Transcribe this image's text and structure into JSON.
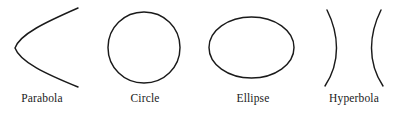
{
  "figure": {
    "background_color": "#ffffff",
    "stroke_color": "#1a1a1a",
    "width": 400,
    "height": 115,
    "items": [
      {
        "name": "parabola",
        "label": "Parabola",
        "label_x": 42,
        "label_y": 92,
        "path": "M 78 8 C 46 22 20 34 15 48 C 20 62 46 74 78 87"
      },
      {
        "name": "circle",
        "label": "Circle",
        "label_x": 145,
        "label_y": 92,
        "path": "M 108 47.5 C 108 27.5 124 12 144 12 C 164 12 180 27.5 180 47.5 C 180 67.5 164 83 144 83 C 124 83 108 67.5 108 47.5 Z"
      },
      {
        "name": "ellipse",
        "label": "Ellipse",
        "label_x": 253,
        "label_y": 92,
        "path": "M 209 47.5 C 209 30.5 228 17 251.5 17 C 275 17 294 30.5 294 47.5 C 294 64.5 275 78 251.5 78 C 228 78 209 64.5 209 47.5 Z"
      },
      {
        "name": "hyperbola",
        "label": "Hyperbola",
        "label_x": 354,
        "label_y": 92,
        "path_left": "M 327 10 C 334 24 336.5 36 336.5 48 C 336.5 61 333 74 325 86",
        "path_right": "M 381 10 C 374 24 371.5 36 371.5 48 C 371.5 61 375 74 383 86"
      }
    ]
  }
}
